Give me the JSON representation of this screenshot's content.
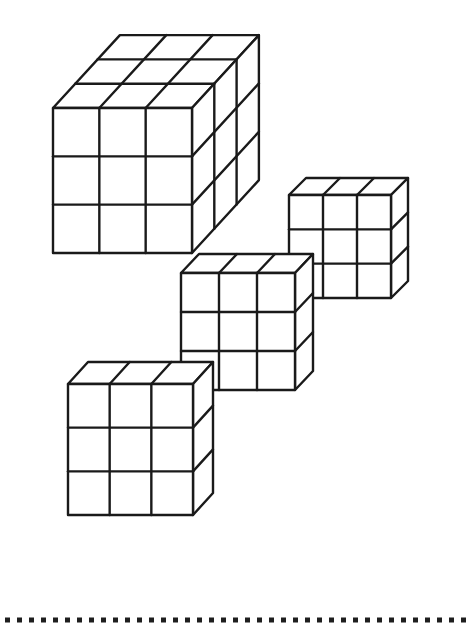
{
  "worksheet": {
    "stroke_color": "#1a1a1a",
    "background": "#ffffff",
    "cubes": [
      {
        "name": "large-cube-3x3x3",
        "x": 53,
        "y": 108,
        "w": 139,
        "h": 145,
        "cols": 3,
        "rows": 3,
        "depth": 3,
        "dx": 22.3,
        "dy": -24.3
      },
      {
        "name": "cube-3x3x1-top-right",
        "x": 289,
        "y": 195,
        "w": 102,
        "h": 103,
        "cols": 3,
        "rows": 3,
        "depth": 1,
        "dx": 17,
        "dy": -17
      },
      {
        "name": "cube-3x3x1-middle",
        "x": 181,
        "y": 273,
        "w": 114,
        "h": 117,
        "cols": 3,
        "rows": 3,
        "depth": 1,
        "dx": 18,
        "dy": -19
      },
      {
        "name": "cube-3x3x1-bottom-left",
        "x": 68,
        "y": 384,
        "w": 125,
        "h": 131,
        "cols": 3,
        "rows": 3,
        "depth": 1,
        "dx": 20,
        "dy": -22
      }
    ],
    "cut_line": {
      "y": 620,
      "start_x": 5,
      "end_x": 473,
      "dot_size": 5,
      "spacing": 12,
      "color": "#1e1e1e"
    }
  }
}
